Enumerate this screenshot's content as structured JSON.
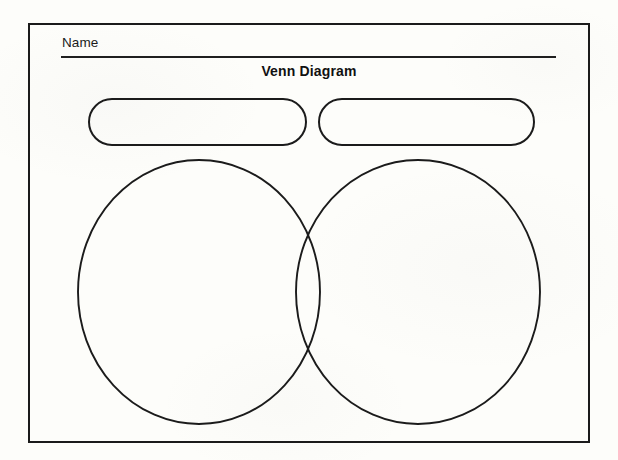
{
  "document": {
    "title": "Venn Diagram",
    "type": "worksheet",
    "orientation": "landscape",
    "background_color": "#fdfdfa",
    "ink_color": "#1b1b1b"
  },
  "name_field": {
    "label": "Name",
    "value": "",
    "placeholder": "",
    "rule_color": "#1f1f1f"
  },
  "heading": {
    "text": "Venn Diagram",
    "bold": true,
    "align": "center"
  },
  "label_boxes": [
    {
      "id": "left-set-label",
      "shape": "rounded-rectangle",
      "value": "",
      "placeholder": ""
    },
    {
      "id": "right-set-label",
      "shape": "rounded-rectangle",
      "value": "",
      "placeholder": ""
    }
  ],
  "venn": {
    "shape": "two-circle",
    "stroke_color": "#1b1b1b",
    "fill": "none",
    "circles": [
      {
        "id": "left-circle",
        "cx": 199,
        "cy": 292,
        "rx": 121,
        "ry": 132,
        "label": ""
      },
      {
        "id": "right-circle",
        "cx": 418,
        "cy": 292,
        "rx": 122,
        "ry": 132,
        "label": ""
      }
    ],
    "regions": [
      {
        "id": "left-only",
        "label": ""
      },
      {
        "id": "intersection",
        "label": ""
      },
      {
        "id": "right-only",
        "label": ""
      }
    ]
  },
  "frame": {
    "border_color": "#1b1b1b",
    "border_width_px": 2
  }
}
